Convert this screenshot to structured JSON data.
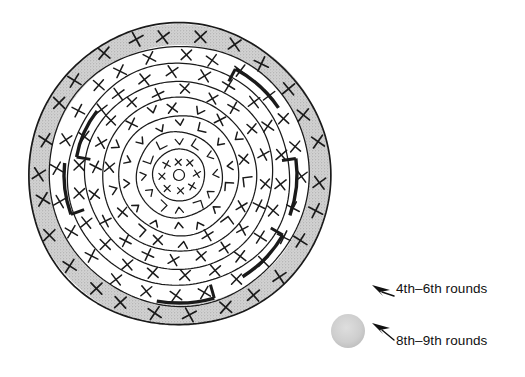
{
  "figure": {
    "type": "diagram",
    "center": {
      "x": 179,
      "y": 175
    },
    "outer_radius": 151
  },
  "diagram": {
    "rings": [
      {
        "name": "outer-shaded-ring",
        "r_outer": 151,
        "r_inner": 130,
        "fill": "#cfcfcf",
        "marks": 26,
        "mark": "x",
        "mark_size": 11
      },
      {
        "name": "ring-7",
        "r_outer": 130,
        "r_inner": 111,
        "fill": "#ffffff",
        "marks": 24,
        "mark": "x",
        "mark_size": 10
      },
      {
        "name": "ring-6",
        "r_outer": 111,
        "r_inner": 94,
        "fill": "#ffffff",
        "marks": 22,
        "mark": "x",
        "mark_size": 10
      },
      {
        "name": "ring-5",
        "r_outer": 94,
        "r_inner": 77,
        "fill": "#ffffff",
        "marks": 20,
        "mark": "x",
        "mark_size": 9
      },
      {
        "name": "ring-4",
        "r_outer": 77,
        "r_inner": 60,
        "fill": "#ffffff",
        "marks": 18,
        "mark": "mixed",
        "mark_size": 9
      },
      {
        "name": "ring-3",
        "r_outer": 60,
        "r_inner": 43,
        "fill": "#ffffff",
        "marks": 14,
        "mark": "bracket",
        "mark_size": 8
      },
      {
        "name": "ring-2",
        "r_outer": 43,
        "r_inner": 26,
        "fill": "#ffffff",
        "marks": 12,
        "mark": "bracket",
        "mark_size": 8
      },
      {
        "name": "inner-disc",
        "r_outer": 26,
        "r_inner": 5,
        "fill": "#ffffff",
        "marks": 8,
        "mark": "x",
        "mark_size": 6
      },
      {
        "name": "core-circle",
        "r_outer": 5,
        "r_inner": 0,
        "fill": "#ffffff",
        "marks": 0,
        "mark": "none",
        "mark_size": 0
      }
    ],
    "thick_arcs": [
      {
        "name": "arc-top-right",
        "start_deg": 298,
        "end_deg": 326,
        "radius": 120
      },
      {
        "name": "arc-upper-left",
        "start_deg": 190,
        "end_deg": 218,
        "radius": 104
      },
      {
        "name": "arc-right",
        "start_deg": 352,
        "end_deg": 20,
        "radius": 118
      },
      {
        "name": "arc-left",
        "start_deg": 160,
        "end_deg": 186,
        "radius": 115
      },
      {
        "name": "arc-lower-right",
        "start_deg": 30,
        "end_deg": 58,
        "radius": 120
      },
      {
        "name": "arc-bottom",
        "start_deg": 74,
        "end_deg": 100,
        "radius": 128
      }
    ]
  },
  "legend": {
    "items": [
      {
        "id": "legend-row-1",
        "marker": "arrow",
        "label": "4th–6th rounds",
        "arrow_color": "#111111"
      },
      {
        "id": "legend-row-2",
        "marker": "grey-circle-and-arrow",
        "label": "8th–9th rounds",
        "arrow_color": "#111111",
        "swatch_color": "#cccccc"
      }
    ]
  },
  "colors": {
    "stroke": "#1a1a1a",
    "shaded_ring": "#cfcfcf",
    "background": "#ffffff",
    "text": "#111111"
  }
}
